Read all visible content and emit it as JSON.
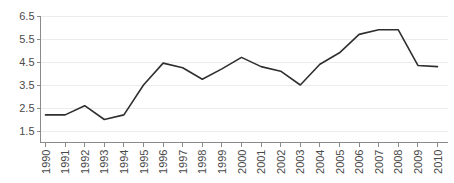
{
  "chart_data": {
    "type": "line",
    "title": "",
    "subtitle": "",
    "xlabel": "",
    "ylabel": "",
    "categories": [
      "1990",
      "1991",
      "1992",
      "1993",
      "1994",
      "1995",
      "1996",
      "1997",
      "1998",
      "1999",
      "2000",
      "2001",
      "2002",
      "2003",
      "2004",
      "2005",
      "2006",
      "2007",
      "2008",
      "2009",
      "2010"
    ],
    "values": [
      2.2,
      2.2,
      2.6,
      2.0,
      2.2,
      3.5,
      4.45,
      4.25,
      3.75,
      4.2,
      4.7,
      4.3,
      4.1,
      3.5,
      4.4,
      4.9,
      5.7,
      5.9,
      5.9,
      4.35,
      4.3
    ],
    "ylim": [
      1.5,
      6.5
    ],
    "yticks": [
      1.5,
      2.5,
      3.5,
      4.5,
      5.5,
      6.5
    ],
    "ytick_labels": [
      "1.5",
      "2.5",
      "3.5",
      "4.5",
      "5.5",
      "6.5"
    ],
    "xtick_labels": [
      "1990",
      "1991",
      "1992",
      "1993",
      "1994",
      "1995",
      "1996",
      "1997",
      "1998",
      "1999",
      "2000",
      "2001",
      "2002",
      "2003",
      "2004",
      "2005",
      "2006",
      "2007",
      "2008",
      "2009",
      "2010"
    ],
    "grid": true,
    "grid_axis": "y",
    "legend": false,
    "legend_position": "none",
    "series": [
      {
        "name": "series-1",
        "color": "#2f2f2f",
        "values": [
          2.2,
          2.2,
          2.6,
          2.0,
          2.2,
          3.5,
          4.45,
          4.25,
          3.75,
          4.2,
          4.7,
          4.3,
          4.1,
          3.5,
          4.4,
          4.9,
          5.7,
          5.9,
          5.9,
          4.35,
          4.3
        ]
      }
    ],
    "xtick_label_rotation": -90
  },
  "style": {
    "series_color": "#2f2f2f",
    "grid_color": "#ececec",
    "axis_color": "#8a8a8a",
    "tick_text_color": "#4a4a4a",
    "background": "#ffffff"
  }
}
